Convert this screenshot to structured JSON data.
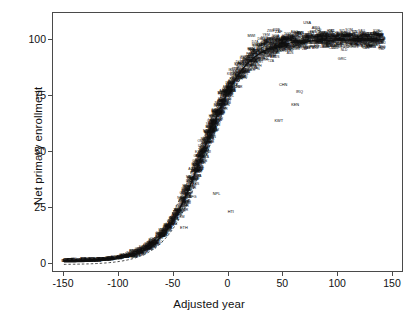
{
  "chart_data": {
    "type": "scatter",
    "title": "",
    "xlabel": "Adjusted year",
    "ylabel": "Net primary enrollment",
    "xlim": [
      -160,
      160
    ],
    "ylim": [
      -4,
      112
    ],
    "xticks": [
      -150,
      -100,
      -50,
      0,
      50,
      100,
      150
    ],
    "xtick_labels": [
      "-150",
      "-100",
      "-50",
      "0",
      "50",
      "100",
      "150"
    ],
    "yticks": [
      0,
      25,
      50,
      75,
      100
    ],
    "ytick_labels": [
      "0",
      "25",
      "50",
      "75",
      "100"
    ],
    "grid": false,
    "legend": "none",
    "point_marker": "country-code-text-label",
    "fit_curve": {
      "name": "logistic fit",
      "style": "solid",
      "color": "#111111",
      "model": "y = 100 / (1 + exp(-(x + 22) / 19))",
      "asymptote": 100,
      "midpoint_x": -22,
      "scale": 19
    },
    "confidence_bands": {
      "name": "pointwise confidence interval",
      "style": "dashed",
      "color": "#333333",
      "offset_units": 3.2
    },
    "series": [
      {
        "name": "countries",
        "labels_visible": [
          "USA",
          "ARG",
          "NZL",
          "GRC",
          "KEN",
          "KWT",
          "CHN",
          "MWI",
          "ZAF",
          "IRQ",
          "NPL",
          "AFG",
          "ETH",
          "PAK",
          "IND",
          "BGD",
          "NER",
          "MLI",
          "TCD",
          "SOM",
          "YEM",
          "SDN",
          "BEN",
          "GIN",
          "SEN",
          "GHA",
          "EGY",
          "TUR",
          "BRA",
          "MEX",
          "CHL",
          "PER",
          "COL",
          "ESP",
          "ITA",
          "FRA",
          "DEU",
          "GBR",
          "SWE",
          "NOR",
          "DNK",
          "FIN",
          "JPN",
          "KOR",
          "AUS",
          "CAN",
          "NLD",
          "BEL",
          "CHE",
          "AUT",
          "PRT",
          "POL",
          "HUN",
          "ROU",
          "BGR",
          "RUS",
          "UKR",
          "THA",
          "IDN",
          "PHL",
          "VNM",
          "MYS",
          "LKA",
          "IRN",
          "SYR",
          "JOR",
          "TUN",
          "MAR",
          "DZA",
          "ZWE",
          "ZMB",
          "TZA",
          "UGA",
          "MOZ",
          "AGO",
          "CMR",
          "CIV",
          "BFA",
          "TGO",
          "RWA",
          "BDI",
          "MDG",
          "MRT",
          "GMB",
          "SLE",
          "LBR",
          "HTI",
          "BOL",
          "ECU",
          "PRY",
          "URY",
          "CRI",
          "PAN",
          "GTM",
          "HND",
          "NIC",
          "SLV",
          "DOM",
          "JAM",
          "TTO",
          "CUB",
          "ISR",
          "SAU",
          "OMN",
          "QAT",
          "BHR",
          "ARE",
          "LBY",
          "GRL",
          "ISL",
          "IRL",
          "LUX",
          "NZL"
        ],
        "approx_n_points": 1600,
        "x_range": [
          -150,
          142
        ],
        "y_range": [
          0,
          107
        ],
        "description": "Net primary enrollment rises from ~0 at adjusted year -150 through a steep transition centered near adjusted year -20, saturating near 95-100 beyond adjusted year +40."
      }
    ],
    "sampled_points": [
      {
        "label": "MWI",
        "x": 22,
        "y": 101
      },
      {
        "label": "ZAF",
        "x": 47,
        "y": 103
      },
      {
        "label": "USA",
        "x": 73,
        "y": 107
      },
      {
        "label": "ARG",
        "x": 81,
        "y": 105
      },
      {
        "label": "NZL",
        "x": 132,
        "y": 97
      },
      {
        "label": "GRC",
        "x": 105,
        "y": 91
      },
      {
        "label": "KEN",
        "x": 62,
        "y": 70
      },
      {
        "label": "KWT",
        "x": 47,
        "y": 63
      },
      {
        "label": "CHN",
        "x": 51,
        "y": 79
      },
      {
        "label": "IRQ",
        "x": 66,
        "y": 76
      },
      {
        "label": "NPL",
        "x": -10,
        "y": 30
      },
      {
        "label": "AFG",
        "x": -32,
        "y": 29
      },
      {
        "label": "HTI",
        "x": 3,
        "y": 22
      },
      {
        "label": "ETH",
        "x": -40,
        "y": 15
      }
    ]
  },
  "axes": {
    "x_title": "Adjusted year",
    "y_title": "Net primary enrollment"
  }
}
